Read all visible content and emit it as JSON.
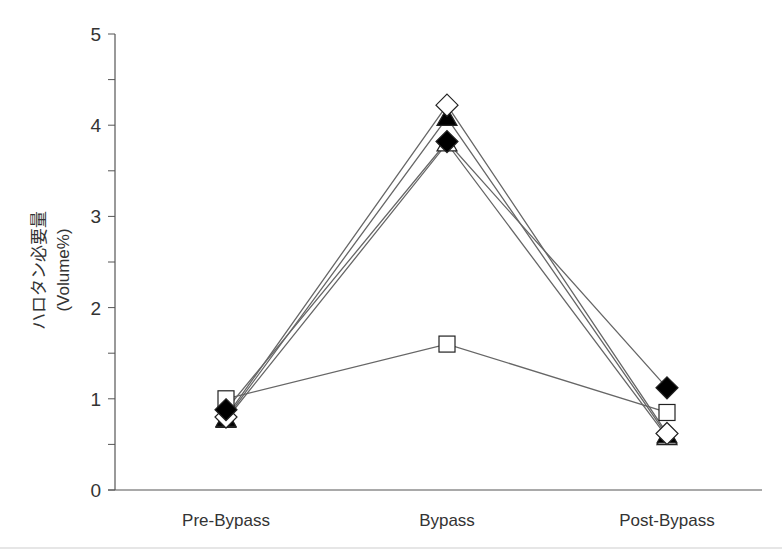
{
  "chart_data": {
    "type": "line",
    "title": "",
    "xlabel": "",
    "ylabel": "ハロタン必要量",
    "ylabel_unit": "(Volume%)",
    "categories": [
      "Pre-Bypass",
      "Bypass",
      "Post-Bypass"
    ],
    "ylim": [
      0,
      5
    ],
    "yticks": [
      "0",
      "1",
      "2",
      "3",
      "4",
      "5"
    ],
    "grid": false,
    "legend": "none",
    "series": [
      {
        "name": "open-square",
        "marker": "square",
        "filled": false,
        "values": [
          1.0,
          1.6,
          0.85
        ]
      },
      {
        "name": "filled-diamond",
        "marker": "diamond",
        "filled": true,
        "values": [
          0.88,
          3.82,
          1.12
        ]
      },
      {
        "name": "open-diamond",
        "marker": "diamond",
        "filled": false,
        "values": [
          0.8,
          4.22,
          0.62
        ]
      },
      {
        "name": "filled-triangle",
        "marker": "triangle",
        "filled": true,
        "values": [
          0.78,
          4.08,
          0.6
        ]
      },
      {
        "name": "open-triangle",
        "marker": "triangle",
        "filled": false,
        "values": [
          0.77,
          3.8,
          0.58
        ]
      }
    ]
  },
  "colors": {
    "axis": "#555555",
    "line": "#666666",
    "marker_fill_dark": "#000000",
    "marker_fill_light": "#ffffff"
  }
}
